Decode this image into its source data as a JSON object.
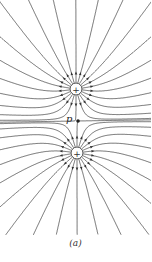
{
  "figure": {
    "caption": "(a)",
    "point_label": "p",
    "colors": {
      "line": "#333333",
      "background": "#ffffff"
    },
    "charges": [
      {
        "id": "top",
        "sign": "+",
        "x": 76,
        "y": 89,
        "r": 6
      },
      {
        "id": "bottom",
        "sign": "+",
        "x": 77,
        "y": 153,
        "r": 6
      }
    ],
    "point": {
      "x": 77,
      "y": 121
    },
    "field_lines_per_charge": 22
  }
}
